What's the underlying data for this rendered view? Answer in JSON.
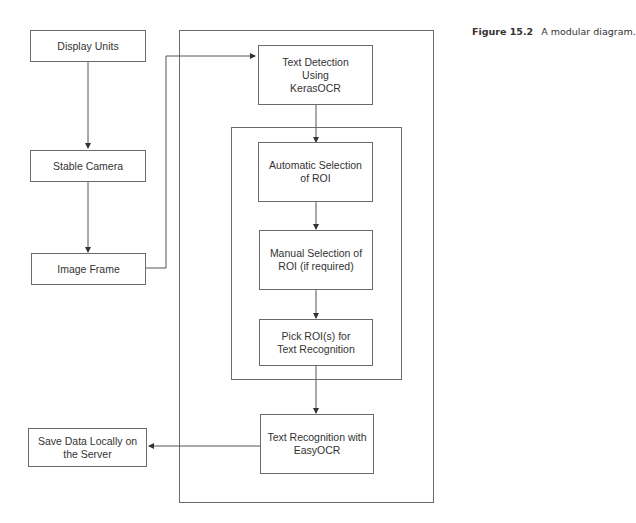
{
  "caption": {
    "label": "Figure 15.2",
    "text": "A modular diagram."
  },
  "nodes": {
    "display_units": "Display Units",
    "stable_camera": "Stable Camera",
    "image_frame": "Image Frame",
    "text_detection": "Text Detection Using KerasOCR",
    "auto_roi": "Automatic Selection of ROI",
    "manual_roi": "Manual Selection of ROI (if required)",
    "pick_roi": "Pick ROI(s) for Text Recognition",
    "text_recognition": "Text Recognition with EasyOCR",
    "save_data": "Save Data Locally on the Server"
  },
  "edges": [
    {
      "from": "Display Units",
      "to": "Stable Camera"
    },
    {
      "from": "Stable Camera",
      "to": "Image Frame"
    },
    {
      "from": "Image Frame",
      "to": "Text Detection Using KerasOCR"
    },
    {
      "from": "Text Detection Using KerasOCR",
      "to": "Automatic Selection of ROI"
    },
    {
      "from": "Automatic Selection of ROI",
      "to": "Manual Selection of ROI (if required)"
    },
    {
      "from": "Manual Selection of ROI (if required)",
      "to": "Pick ROI(s) for Text Recognition"
    },
    {
      "from": "Pick ROI(s) for Text Recognition",
      "to": "Text Recognition with EasyOCR"
    },
    {
      "from": "Text Recognition with EasyOCR",
      "to": "Save Data Locally on the Server"
    }
  ]
}
